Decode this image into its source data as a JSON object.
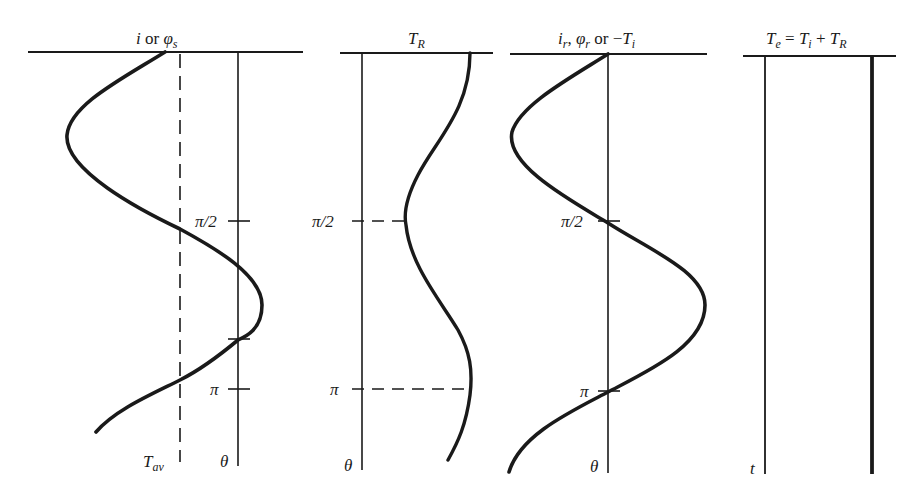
{
  "colors": {
    "ink": "#1a1a1a",
    "background": "#ffffff"
  },
  "panels": [
    {
      "id": "panel-1",
      "title": {
        "main": "i",
        "connector": " or ",
        "symbol": "φ",
        "subscript": "s"
      },
      "axis_label": "θ",
      "dashed_label": {
        "main": "T",
        "subscript": "av"
      },
      "ticks": [
        {
          "label": "π/2"
        },
        {
          "label": ""
        },
        {
          "label": "π"
        }
      ]
    },
    {
      "id": "panel-2",
      "title": {
        "main": "T",
        "subscript": "R"
      },
      "axis_label": "θ",
      "ticks": [
        {
          "label": "π/2"
        },
        {
          "label": "π"
        }
      ]
    },
    {
      "id": "panel-3",
      "title": {
        "p1_main": "i",
        "p1_sub": "r",
        "sep": ", ",
        "p2_main": "φ",
        "p2_sub": "r",
        "connector": " or −",
        "p3_main": "T",
        "p3_sub": "i"
      },
      "axis_label": "θ",
      "ticks": [
        {
          "label": "π/2"
        },
        {
          "label": "π"
        }
      ]
    },
    {
      "id": "panel-4",
      "title": {
        "lhs_main": "T",
        "lhs_sub": "e",
        "eq": " = ",
        "t1_main": "T",
        "t1_sub": "i",
        "plus": " + ",
        "t2_main": "T",
        "t2_sub": "R"
      },
      "axis_label": "t"
    }
  ]
}
